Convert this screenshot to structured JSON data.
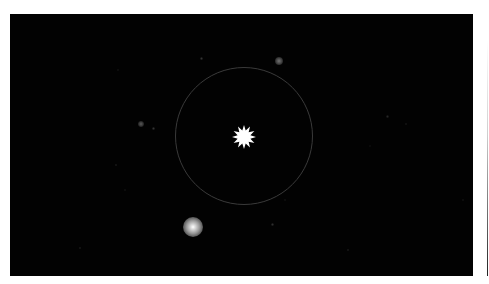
{
  "image": {
    "description": "Astronomical star field with a marked target star inside a circular aperture",
    "background_color": "#020202",
    "frame": {
      "x": 10,
      "y": 14,
      "width": 463,
      "height": 262
    },
    "target": {
      "cx": 244,
      "cy": 137,
      "radius": 12,
      "color": "#ffffff",
      "points": 12
    },
    "aperture_ring": {
      "cx": 244,
      "cy": 136,
      "radius": 69,
      "color": "#3a3a3a"
    },
    "stars": [
      {
        "x": 193,
        "y": 227,
        "r": 10,
        "brightness": 1.0
      },
      {
        "x": 279,
        "y": 61,
        "r": 4,
        "brightness": 0.45
      },
      {
        "x": 141,
        "y": 124,
        "r": 3,
        "brightness": 0.35
      },
      {
        "x": 153,
        "y": 128,
        "r": 1.5,
        "brightness": 0.2
      },
      {
        "x": 201,
        "y": 58,
        "r": 1.5,
        "brightness": 0.2
      },
      {
        "x": 387,
        "y": 116,
        "r": 1.5,
        "brightness": 0.15
      },
      {
        "x": 406,
        "y": 124,
        "r": 1.2,
        "brightness": 0.12
      },
      {
        "x": 116,
        "y": 165,
        "r": 1.2,
        "brightness": 0.15
      },
      {
        "x": 272,
        "y": 224,
        "r": 1.5,
        "brightness": 0.18
      },
      {
        "x": 80,
        "y": 248,
        "r": 1.2,
        "brightness": 0.15
      },
      {
        "x": 348,
        "y": 250,
        "r": 1.2,
        "brightness": 0.15
      },
      {
        "x": 118,
        "y": 70,
        "r": 1,
        "brightness": 0.1
      },
      {
        "x": 285,
        "y": 200,
        "r": 1,
        "brightness": 0.1
      },
      {
        "x": 463,
        "y": 200,
        "r": 1,
        "brightness": 0.1
      },
      {
        "x": 125,
        "y": 190,
        "r": 1,
        "brightness": 0.1
      },
      {
        "x": 370,
        "y": 146,
        "r": 1,
        "brightness": 0.08
      }
    ]
  }
}
